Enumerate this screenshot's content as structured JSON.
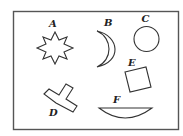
{
  "diagram": {
    "frame": {
      "x": 13.5,
      "y": 11.5,
      "width": 165,
      "height": 118
    },
    "shapes": [
      {
        "id": "A",
        "label": "A",
        "type": "eight-point-star",
        "label_pos": [
          52,
          27
        ]
      },
      {
        "id": "B",
        "label": "B",
        "type": "crescent",
        "label_pos": [
          106,
          26
        ]
      },
      {
        "id": "C",
        "label": "C",
        "type": "circle",
        "label_pos": [
          144,
          22
        ]
      },
      {
        "id": "D",
        "label": "D",
        "type": "t-shape",
        "label_pos": [
          52,
          116
        ]
      },
      {
        "id": "E",
        "label": "E",
        "type": "square-rotated",
        "label_pos": [
          131,
          66
        ]
      },
      {
        "id": "F",
        "label": "F",
        "type": "circular-segment",
        "label_pos": [
          115,
          103
        ]
      }
    ]
  }
}
